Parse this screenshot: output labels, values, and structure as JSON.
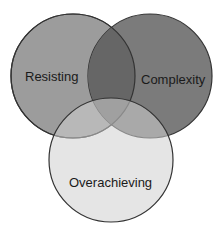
{
  "diagram": {
    "type": "venn",
    "sets": [
      {
        "id": "resisting",
        "label": "Resisting",
        "fill": "#9c9c9c",
        "cx": 73,
        "cy": 76,
        "r": 62
      },
      {
        "id": "complexity",
        "label": "Complexity",
        "fill": "#7b7b7b",
        "cx": 150,
        "cy": 76,
        "r": 62
      },
      {
        "id": "overachieving",
        "label": "Overachieving",
        "fill": "#c6c6c6",
        "cx": 111,
        "cy": 160,
        "r": 62
      }
    ],
    "colors": {
      "stroke": "#333333",
      "overlap_top": "#666666",
      "background": "#ffffff"
    }
  }
}
